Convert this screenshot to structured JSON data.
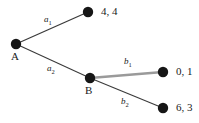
{
  "diagram": {
    "type": "extensive-form-game-tree",
    "background_color": "#ffffff",
    "node_color": "#161616",
    "edge_color": "#3a3a3a",
    "highlight_edge_color": "#9a9a9a",
    "decision_nodes": [
      {
        "id": "A",
        "label": "A",
        "x": 16,
        "y": 44,
        "r": 5
      },
      {
        "id": "B",
        "label": "B",
        "x": 90,
        "y": 78,
        "r": 5
      }
    ],
    "terminal_nodes": [
      {
        "id": "t1",
        "x": 88,
        "y": 12,
        "r": 5,
        "payoff": "4, 4"
      },
      {
        "id": "t2",
        "x": 163,
        "y": 72,
        "r": 5,
        "payoff": "0, 1"
      },
      {
        "id": "t3",
        "x": 163,
        "y": 108,
        "r": 5,
        "payoff": "6, 3"
      }
    ],
    "edges": [
      {
        "id": "e-a1",
        "from": "A",
        "to": "t1",
        "action": "a",
        "subscript": "1",
        "label_x": 44,
        "label_y": 19,
        "highlighted": false,
        "width": 1.1
      },
      {
        "id": "e-a2",
        "from": "A",
        "to": "B",
        "action": "a",
        "subscript": "2",
        "label_x": 47,
        "label_y": 68,
        "highlighted": false,
        "width": 1.1
      },
      {
        "id": "e-b1",
        "from": "B",
        "to": "t2",
        "action": "b",
        "subscript": "1",
        "label_x": 124,
        "label_y": 61,
        "highlighted": true,
        "width": 2.6
      },
      {
        "id": "e-b2",
        "from": "B",
        "to": "t3",
        "action": "b",
        "subscript": "2",
        "label_x": 121,
        "label_y": 101,
        "highlighted": false,
        "width": 1.1
      }
    ]
  }
}
